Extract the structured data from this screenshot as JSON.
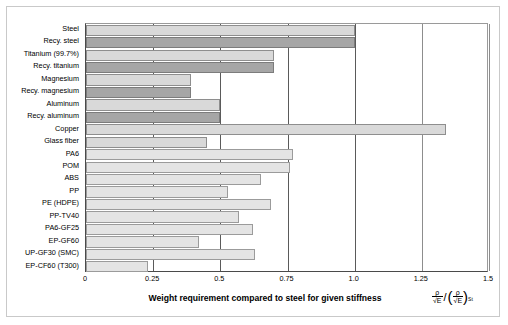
{
  "chart_data": {
    "type": "bar",
    "orientation": "horizontal",
    "title": "",
    "xlabel": "Weight requirement compared to steel for given stiffness",
    "ylabel": "",
    "xlim": [
      0,
      1.5
    ],
    "xticks": [
      "0",
      "0.25",
      "0.5",
      "0.75",
      "1.0",
      "1.25",
      "1.5"
    ],
    "xtickvalues": [
      0,
      0.25,
      0.5,
      0.75,
      1.0,
      1.25,
      1.5
    ],
    "grid": true,
    "legend": null,
    "axis_formula": {
      "numerator_top": "ρ",
      "numerator_bottom": "√E",
      "denominator_top": "ρ",
      "denominator_bottom": "√E",
      "subscript": "St"
    },
    "categories": [
      "Steel",
      "Recy. steel",
      "Titanium (99.7%)",
      "Recy. titanium",
      "Magnesium",
      "Recy. magnesium",
      "Aluminum",
      "Recy. aluminum",
      "Copper",
      "Glass fiber",
      "PA6",
      "POM",
      "ABS",
      "PP",
      "PE (HDPE)",
      "PP-TV40",
      "PA6-GF25",
      "EP-GF60",
      "UP-GF30 (SMC)",
      "EP-CF60 (T300)"
    ],
    "values": [
      1.0,
      1.0,
      0.7,
      0.7,
      0.39,
      0.39,
      0.5,
      0.5,
      1.34,
      0.45,
      0.77,
      0.76,
      0.65,
      0.53,
      0.69,
      0.57,
      0.62,
      0.42,
      0.63,
      0.23
    ],
    "bar_styles": [
      "light",
      "dark",
      "light",
      "dark",
      "light",
      "dark",
      "light",
      "dark",
      "light",
      "light",
      "plastic",
      "plastic",
      "plastic",
      "plastic",
      "plastic",
      "plastic",
      "plastic",
      "plastic",
      "plastic",
      "plastic"
    ],
    "colors": {
      "primary_bar": "#d9d9d9",
      "recycled_bar": "#a6a6a6",
      "plastic_bar": "#e4e4e4",
      "bar_border": "#8e8e8e",
      "grid_line": "#8d8d8d",
      "axis_line": "#4a4a4a",
      "frame_border": "#c9c9c9",
      "background": "#ffffff",
      "text": "#000000"
    }
  }
}
